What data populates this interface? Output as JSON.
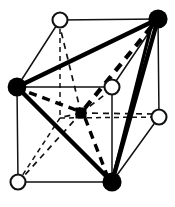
{
  "figure": {
    "type": "crystal-structure-diagram",
    "width": 175,
    "height": 207,
    "background_color": "#ffffff",
    "line_color": "#111111",
    "atom_fill_color": "#000000",
    "atom_open_fill": "#ffffff"
  },
  "geometry": {
    "description": "Cube drawn in oblique projection; back face up-right, front face down-left.",
    "cube_vertices": [
      {
        "id": "back-top-left",
        "x": 60,
        "y": 20,
        "marker": "open-circle",
        "radius": 7.5
      },
      {
        "id": "back-top-right",
        "x": 158,
        "y": 19,
        "marker": "filled-circle",
        "radius": 9.5
      },
      {
        "id": "front-top-left",
        "x": 17,
        "y": 87,
        "marker": "filled-circle",
        "radius": 9.5
      },
      {
        "id": "front-top-right",
        "x": 112,
        "y": 87,
        "marker": "open-circle",
        "radius": 7.5
      },
      {
        "id": "back-bottom-right",
        "x": 159,
        "y": 117,
        "marker": "open-circle",
        "radius": 7.5
      },
      {
        "id": "back-bottom-left",
        "x": 60,
        "y": 118,
        "marker": "hidden",
        "radius": 0
      },
      {
        "id": "front-bottom-left",
        "x": 18,
        "y": 182,
        "marker": "open-circle",
        "radius": 7.5
      },
      {
        "id": "front-bottom-right",
        "x": 112,
        "y": 182,
        "marker": "filled-circle",
        "radius": 9.5
      }
    ],
    "body_center": {
      "id": "body-center",
      "x": 81,
      "y": 113,
      "marker": "filled-square",
      "size": 11
    },
    "solid_cube_edges": [
      [
        "back-top-left",
        "back-top-right"
      ],
      [
        "front-top-left",
        "front-top-right"
      ],
      [
        "front-bottom-left",
        "front-bottom-right"
      ],
      [
        "back-top-left",
        "front-top-left"
      ],
      [
        "back-top-right",
        "front-top-right"
      ],
      [
        "back-top-right",
        "back-bottom-right"
      ],
      [
        "back-bottom-right",
        "front-bottom-right"
      ],
      [
        "front-top-left",
        "front-bottom-left"
      ],
      [
        "front-top-right",
        "front-bottom-right"
      ],
      [
        "front-bottom-right",
        "back-bottom-right"
      ]
    ],
    "hidden_cube_edges": [
      [
        "back-top-left",
        "back-bottom-left"
      ],
      [
        "back-bottom-left",
        "back-bottom-right"
      ],
      [
        "back-bottom-left",
        "front-bottom-left"
      ]
    ],
    "tetrahedron_edges_solid": [
      [
        "front-top-left",
        "back-top-right"
      ],
      [
        "front-top-left",
        "front-bottom-right"
      ],
      [
        "front-bottom-right",
        "back-top-right"
      ]
    ],
    "tetrahedron_edges_dashed": [
      [
        "back-top-right",
        "body-center"
      ],
      [
        "front-top-left",
        "body-center"
      ],
      [
        "front-bottom-right",
        "body-center"
      ]
    ],
    "center_dashed_spokes": [
      [
        "body-center",
        "back-top-left"
      ],
      [
        "body-center",
        "back-bottom-right"
      ],
      [
        "body-center",
        "front-top-right"
      ],
      [
        "body-center",
        "front-bottom-left"
      ],
      [
        "body-center",
        "back-bottom-left"
      ]
    ]
  },
  "legend": {
    "filled_circle_meaning": "corner atom of highlighted tetrahedron",
    "open_circle_meaning": "remaining cube corner atom",
    "filled_square_meaning": "body-centre atom"
  },
  "stroke_widths": {
    "thin_edge": 1.4,
    "thick_bond": 4.2,
    "thick_dashed_bond": 4.0,
    "thin_dashed": 1.6,
    "marker_outline": 2.0
  }
}
